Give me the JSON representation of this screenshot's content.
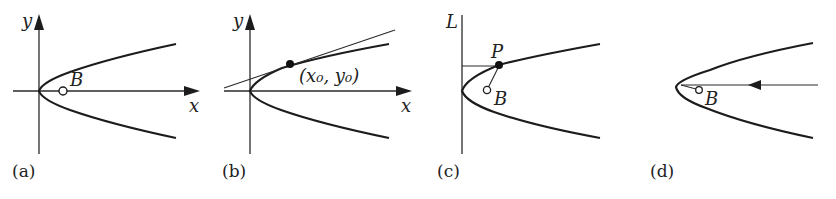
{
  "figure": {
    "panels": [
      {
        "id": "a",
        "caption": "(a)",
        "axis_labels": {
          "y": "y",
          "x": "x"
        },
        "point_labels": {
          "focus": "B"
        }
      },
      {
        "id": "b",
        "caption": "(b)",
        "axis_labels": {
          "y": "y",
          "x": "x"
        },
        "point_labels": {
          "tangent_point": "(x₀, y₀)"
        }
      },
      {
        "id": "c",
        "caption": "(c)",
        "line_labels": {
          "directrix": "L"
        },
        "point_labels": {
          "point": "P",
          "focus": "B"
        }
      },
      {
        "id": "d",
        "caption": "(d)",
        "point_labels": {
          "focus": "B"
        }
      }
    ]
  }
}
